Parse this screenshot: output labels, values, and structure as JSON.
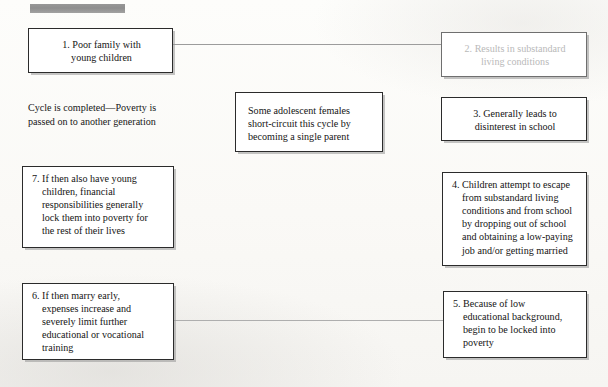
{
  "diagram": {
    "title_bar": {
      "name": "redacted-title-bar",
      "color": "#8e8e8e"
    },
    "background_color": "#fbfaf8",
    "node_border_color": "#2b2b2b",
    "connector_color": "#9c9c9c",
    "faded_text_color": "#b7b7b7"
  },
  "nodes": {
    "n1": {
      "number": "1.",
      "lines": [
        "1. Poor family with",
        "young children"
      ]
    },
    "n2": {
      "number": "2.",
      "lines": [
        "2. Results in substandard",
        "living conditions"
      ]
    },
    "n3": {
      "number": "3.",
      "lines": [
        "3. Generally leads to",
        "disinterest in school"
      ]
    },
    "n4": {
      "number": "4.",
      "lines": [
        "4. Children attempt to escape",
        "from substandard living",
        "conditions and from school",
        "by dropping out of school",
        "and obtaining a low-paying",
        "job and/or getting married"
      ]
    },
    "n5": {
      "number": "5.",
      "lines": [
        "5. Because of low",
        "educational background,",
        "begin to be locked into",
        "poverty"
      ]
    },
    "n6": {
      "number": "6.",
      "lines": [
        "6. If then marry early,",
        "expenses increase and",
        "severely limit further",
        "educational or vocational",
        "training"
      ]
    },
    "n7": {
      "number": "7.",
      "lines": [
        "7. If then also have young",
        "children, financial",
        "responsibilities generally",
        "lock them into poverty for",
        "the rest of their lives"
      ]
    },
    "aside": {
      "lines": [
        "Some adolescent females",
        "short-circuit this cycle by",
        "becoming a single parent"
      ]
    }
  },
  "text_blocks": {
    "cycle_completed": {
      "lines": [
        "Cycle is completed—Poverty is",
        "passed on to another generation"
      ]
    }
  }
}
